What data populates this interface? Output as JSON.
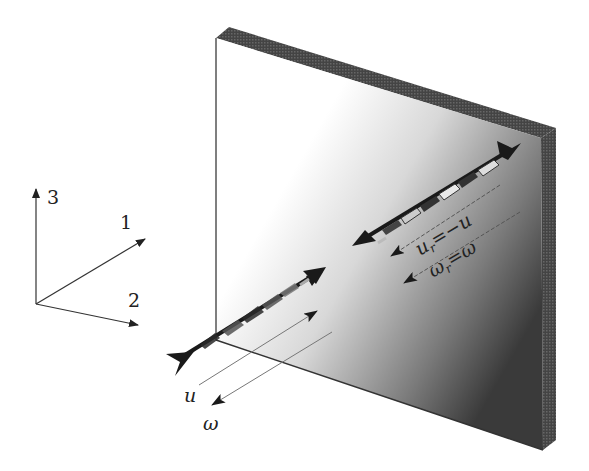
{
  "figure": {
    "axes": {
      "labels": [
        "1",
        "2",
        "3"
      ],
      "axis1_label": "1",
      "axis2_label": "2",
      "axis3_label": "3"
    },
    "incident": {
      "u_label": "u",
      "omega_label": "ω"
    },
    "reflected": {
      "u_label_base": "u",
      "u_label_sub": "r",
      "u_label_rhs": "=−u",
      "omega_label_base": "ω",
      "omega_label_sub": "r",
      "omega_label_rhs": "=ω"
    },
    "colors": {
      "background": "#ffffff",
      "ink": "#222222",
      "wall_edge": "#4a4a4a",
      "wall_gradient_light": "#ffffff",
      "wall_gradient_dark": "#2e2e2e",
      "thin_line": "#777777"
    }
  }
}
